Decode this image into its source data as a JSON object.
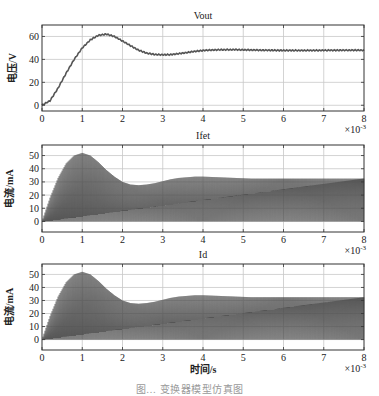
{
  "figure": {
    "xlabel": "时间/s",
    "caption": "图… 变换器模型仿真图",
    "x_multiplier": "×10",
    "x_multiplier_exp": "-3"
  },
  "chart_data": [
    {
      "type": "line",
      "title": "Vout",
      "xlabel": "",
      "ylabel": "电压/V",
      "x_ticks": [
        0,
        1,
        2,
        3,
        4,
        5,
        6,
        7,
        8
      ],
      "y_ticks": [
        0,
        20,
        40,
        60
      ],
      "xlim": [
        0,
        8
      ],
      "ylim": [
        -5,
        70
      ],
      "x_scale": "×10^-3 s",
      "grid": true,
      "series": [
        {
          "name": "Vout",
          "x": [
            0,
            0.2,
            0.4,
            0.6,
            0.8,
            1.0,
            1.2,
            1.4,
            1.6,
            1.8,
            2.0,
            2.2,
            2.4,
            2.6,
            2.8,
            3.0,
            3.2,
            3.4,
            3.6,
            3.8,
            4.0,
            4.4,
            4.8,
            5.2,
            5.6,
            6.0,
            6.5,
            7.0,
            7.5,
            8.0
          ],
          "values": [
            0,
            4,
            15,
            28,
            40,
            50,
            57,
            61,
            62,
            60,
            56,
            52,
            48,
            45.5,
            44.3,
            44,
            44.2,
            45,
            46,
            47,
            47.8,
            48.4,
            48.5,
            48.2,
            48,
            47.8,
            47.8,
            47.9,
            48,
            48
          ]
        }
      ]
    },
    {
      "type": "area",
      "title": "Ifet",
      "xlabel": "",
      "ylabel": "电流/mA",
      "x_ticks": [
        0,
        1,
        2,
        3,
        4,
        5,
        6,
        7,
        8
      ],
      "y_ticks": [
        0,
        10,
        20,
        30,
        40,
        50
      ],
      "xlim": [
        0,
        8
      ],
      "ylim": [
        -8,
        58
      ],
      "x_scale": "×10^-3 s",
      "grid": true,
      "note": "High-frequency switching current; envelope shown (min 0, peak envelope below)",
      "series": [
        {
          "name": "Ifet envelope (peak)",
          "x": [
            0,
            0.2,
            0.4,
            0.6,
            0.8,
            1.0,
            1.2,
            1.4,
            1.6,
            1.8,
            2.0,
            2.2,
            2.4,
            2.6,
            2.8,
            3.0,
            3.2,
            3.4,
            3.6,
            3.8,
            4.0,
            4.4,
            4.8,
            5.2,
            5.6,
            6.0,
            6.5,
            7.0,
            7.5,
            8.0
          ],
          "values": [
            0,
            18,
            33,
            44,
            50,
            52,
            50,
            45,
            39,
            34,
            30,
            28,
            27.5,
            28,
            29,
            30.5,
            32,
            33,
            33.5,
            34,
            34,
            33.5,
            33,
            32.5,
            32.5,
            32.5,
            32.5,
            32.5,
            32.5,
            32.5
          ]
        }
      ]
    },
    {
      "type": "area",
      "title": "Id",
      "xlabel": "时间/s",
      "ylabel": "电流/mA",
      "x_ticks": [
        0,
        1,
        2,
        3,
        4,
        5,
        6,
        7,
        8
      ],
      "y_ticks": [
        0,
        10,
        20,
        30,
        40,
        50
      ],
      "xlim": [
        0,
        8
      ],
      "ylim": [
        -8,
        58
      ],
      "x_scale": "×10^-3 s",
      "grid": true,
      "note": "High-frequency switching current; envelope shown (min 0, peak envelope below)",
      "series": [
        {
          "name": "Id envelope (peak)",
          "x": [
            0,
            0.2,
            0.4,
            0.6,
            0.8,
            1.0,
            1.2,
            1.4,
            1.6,
            1.8,
            2.0,
            2.2,
            2.4,
            2.6,
            2.8,
            3.0,
            3.2,
            3.4,
            3.6,
            3.8,
            4.0,
            4.4,
            4.8,
            5.2,
            5.6,
            6.0,
            6.5,
            7.0,
            7.5,
            8.0
          ],
          "values": [
            0,
            18,
            33,
            44,
            50,
            52,
            50,
            45,
            39,
            34,
            30,
            28,
            27.5,
            28,
            29,
            30.5,
            32,
            33,
            33.5,
            34,
            34,
            33.5,
            33,
            32.5,
            32.5,
            32.5,
            32.5,
            32.5,
            32.5,
            32.5
          ]
        }
      ]
    }
  ],
  "colors": {
    "axis": "#333333",
    "grid": "#c8c8c8",
    "trace": "#555555",
    "fill": "#5a5a5a"
  }
}
